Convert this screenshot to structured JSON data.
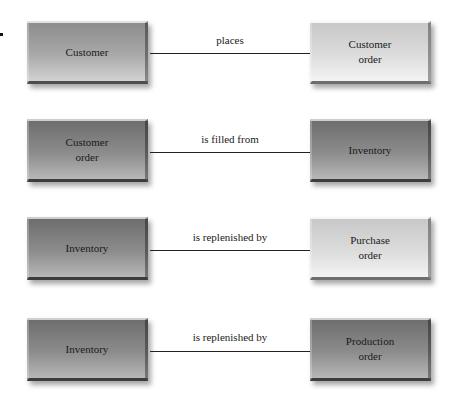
{
  "diagram": {
    "type": "entity-relationship",
    "relationships": [
      {
        "from": "Customer",
        "from_shade": "medium",
        "label": "places",
        "to": "Customer\norder",
        "to_shade": "light"
      },
      {
        "from": "Customer\norder",
        "from_shade": "dark",
        "label": "is filled from",
        "to": "Inventory",
        "to_shade": "dark"
      },
      {
        "from": "Inventory",
        "from_shade": "dark",
        "label": "is replenished by",
        "to": "Purchase\norder",
        "to_shade": "light"
      },
      {
        "from": "Inventory",
        "from_shade": "dark",
        "label": "is replenished by",
        "to": "Production\norder",
        "to_shade": "dark"
      }
    ]
  }
}
